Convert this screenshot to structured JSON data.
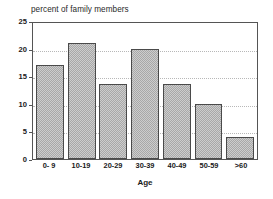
{
  "chart_data": {
    "type": "bar",
    "title": "percent of family members",
    "xlabel": "Age",
    "ylabel": "",
    "categories": [
      "0- 9",
      "10-19",
      "20-29",
      "30-39",
      "40-49",
      "50-59",
      ">60"
    ],
    "values": [
      17,
      21,
      13.5,
      20,
      13.5,
      10,
      4
    ],
    "ylim": [
      0,
      25
    ],
    "yticks": [
      0,
      5,
      10,
      15,
      20,
      25
    ],
    "ytick_labels": [
      "0",
      "5",
      "10",
      "15",
      "20",
      "25"
    ],
    "grid": true,
    "grid_axis": "y",
    "legend": false,
    "colors": {
      "bar_fill": "#a8a8a8",
      "bar_border": "#4a4a4a",
      "gridline": "#b8b8b8",
      "frame": "#555555",
      "text": "#1a1a1a",
      "background": "#ffffff"
    }
  }
}
